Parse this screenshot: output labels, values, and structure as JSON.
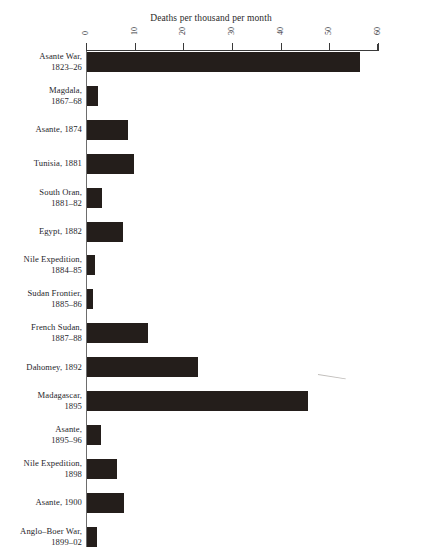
{
  "page": {
    "top_cut_text": "",
    "background_color": "#ffffff",
    "bar_color": "#241e1b",
    "axis_color": "#3a3a3a",
    "text_color": "#26262b"
  },
  "chart_data": {
    "type": "bar",
    "orientation": "horizontal",
    "title": "Deaths per thousand per month",
    "xlabel": "",
    "ylabel": "",
    "xlim": [
      0,
      60
    ],
    "xticks": [
      0,
      10,
      20,
      30,
      40,
      50,
      60
    ],
    "tick_label_rotation": 90,
    "grid": false,
    "legend": false,
    "categories": [
      "Asante War,\n1823–26",
      "Magdala,\n1867–68",
      "Asante, 1874",
      "Tunisia, 1881",
      "South Oran,\n1881–82",
      "Egypt, 1882",
      "Nile Expedition,\n1884–85",
      "Sudan Frontier,\n1885–86",
      "French Sudan,\n1887–88",
      "Dahomey, 1892",
      "Madagascar,\n1895",
      "Asante,\n1895–96",
      "Nile Expedition,\n1898",
      "Asante, 1900",
      "Anglo–Boer War,\n1899–02"
    ],
    "values": [
      56,
      2.3,
      8.4,
      9.6,
      3.1,
      7.4,
      1.7,
      1.2,
      12.5,
      22.8,
      45.4,
      2.9,
      6.2,
      7.6,
      2.1
    ]
  }
}
